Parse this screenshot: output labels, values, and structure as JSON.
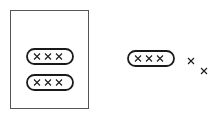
{
  "canvas": {
    "width": 219,
    "height": 118,
    "background": "#ffffff"
  },
  "style": {
    "rect_stroke": "#555555",
    "rect_stroke_width": 1,
    "capsule_stroke": "#1a1a1a",
    "capsule_stroke_width": 1.8,
    "capsule_fill": "#ffffff",
    "mark_stroke": "#1a1a1a",
    "mark_stroke_width": 1.1
  },
  "diagram": {
    "type": "line-art-grouping",
    "container": {
      "label": "container-rectangle",
      "x": 10,
      "y": 10,
      "width": 78,
      "height": 98
    },
    "capsules": [
      {
        "label": "capsule-1",
        "group": "inside-container",
        "x": 27,
        "y": 23,
        "width": 46,
        "height": 15,
        "mark_count": 3,
        "marks": [
          {
            "label": "x-mark",
            "cx": 37,
            "cy": 30.5,
            "size": 6
          },
          {
            "label": "x-mark",
            "cx": 48,
            "cy": 30.5,
            "size": 6
          },
          {
            "label": "x-mark",
            "cx": 59,
            "cy": 30.5,
            "size": 6
          }
        ]
      },
      {
        "label": "capsule-2",
        "group": "inside-container",
        "x": 27,
        "y": 49,
        "width": 46,
        "height": 15,
        "mark_count": 3,
        "marks": [
          {
            "label": "x-mark",
            "cx": 37,
            "cy": 56.5,
            "size": 6
          },
          {
            "label": "x-mark",
            "cx": 48,
            "cy": 56.5,
            "size": 6
          },
          {
            "label": "x-mark",
            "cx": 59,
            "cy": 56.5,
            "size": 6
          }
        ]
      },
      {
        "label": "capsule-3",
        "group": "inside-container",
        "x": 27,
        "y": 75,
        "width": 46,
        "height": 15,
        "mark_count": 3,
        "marks": [
          {
            "label": "x-mark",
            "cx": 37,
            "cy": 82.5,
            "size": 6
          },
          {
            "label": "x-mark",
            "cx": 48,
            "cy": 82.5,
            "size": 6
          },
          {
            "label": "x-mark",
            "cx": 59,
            "cy": 82.5,
            "size": 6
          }
        ]
      },
      {
        "label": "capsule-4",
        "group": "outside-container",
        "x": 128,
        "y": 51,
        "width": 46,
        "height": 15,
        "mark_count": 3,
        "marks": [
          {
            "label": "x-mark",
            "cx": 138,
            "cy": 58.5,
            "size": 6
          },
          {
            "label": "x-mark",
            "cx": 149,
            "cy": 58.5,
            "size": 6
          },
          {
            "label": "x-mark",
            "cx": 160,
            "cy": 58.5,
            "size": 6
          }
        ]
      }
    ],
    "loose_marks": [
      {
        "label": "loose-x-mark-1",
        "cx": 191,
        "cy": 61,
        "size": 6
      },
      {
        "label": "loose-x-mark-2",
        "cx": 204,
        "cy": 71,
        "size": 6
      }
    ],
    "counts": {
      "capsules_in_container": 3,
      "capsules_outside_container": 1,
      "marks_per_capsule": 3,
      "loose_marks": 2,
      "total_marks": 14
    }
  }
}
